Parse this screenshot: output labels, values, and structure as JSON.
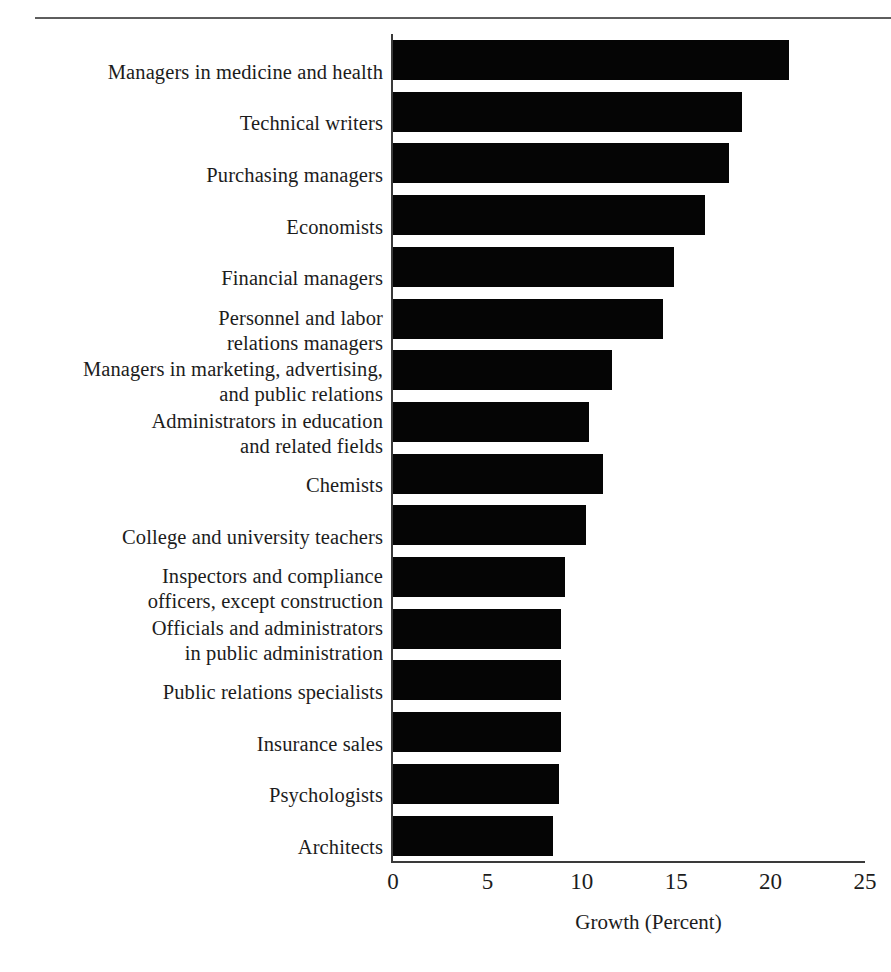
{
  "figure": {
    "has_top_rule": true,
    "background_color": "#ffffff",
    "bar_color": "#050505",
    "axis_color": "#3a3a3a"
  },
  "chart_data": {
    "type": "bar",
    "orientation": "horizontal",
    "title": "",
    "xlabel": "Growth (Percent)",
    "ylabel": "",
    "xlim": [
      0,
      25
    ],
    "xticks": [
      0,
      5,
      10,
      15,
      20,
      25
    ],
    "xtick_labels": [
      "0",
      "5",
      "10",
      "15",
      "20",
      "25"
    ],
    "grid": false,
    "legend": false,
    "categories": [
      "Managers in medicine and health",
      "Technical writers",
      "Purchasing managers",
      "Economists",
      "Financial managers",
      "Personnel and labor\nrelations managers",
      "Managers in marketing, advertising,\nand public relations",
      "Administrators in education\nand related fields",
      "Chemists",
      "College and university teachers",
      "Inspectors and compliance\nofficers, except construction",
      "Officials and administrators\nin public administration",
      "Public relations specialists",
      "Insurance sales",
      "Psychologists",
      "Architects"
    ],
    "values": [
      21.0,
      18.5,
      17.8,
      16.5,
      14.9,
      14.3,
      11.6,
      10.4,
      11.1,
      10.2,
      9.1,
      8.9,
      8.9,
      8.9,
      8.8,
      8.5
    ]
  }
}
